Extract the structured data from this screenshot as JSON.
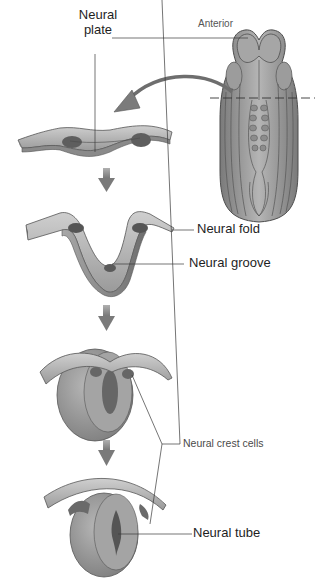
{
  "figure": {
    "labels": {
      "neural_plate": [
        "Neural",
        "plate"
      ],
      "anterior": "Anterior",
      "neural_fold": "Neural fold",
      "neural_groove": "Neural groove",
      "neural_crest_cells": "Neural crest cells",
      "neural_tube": "Neural tube"
    },
    "stages": [
      {
        "id": "embryo-dorsal-view",
        "description": "Dorsal view of embryo with cross-section plane"
      },
      {
        "id": "neural-plate-stage",
        "description": "Flat neural plate"
      },
      {
        "id": "neural-groove-stage",
        "description": "Neural folds rise forming groove"
      },
      {
        "id": "closing-stage",
        "description": "Folds meet, crest cells detach"
      },
      {
        "id": "neural-tube-stage",
        "description": "Closed neural tube beneath ectoderm"
      }
    ],
    "colors": {
      "tissue_light": "#b9b9b9",
      "tissue_mid": "#8f8f8f",
      "tissue_dark": "#5a5a5a",
      "leader_line": "#3a3a3a",
      "arrow": "#7d7d7d"
    }
  }
}
